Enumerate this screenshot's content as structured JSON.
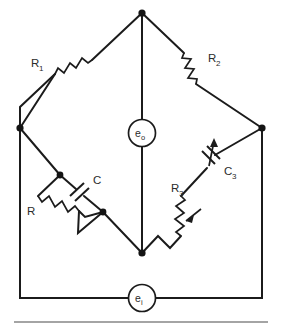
{
  "figure": {
    "type": "circuit-diagram",
    "name": "wien-bridge-circuit",
    "background_color": "#ffffff",
    "line_color": "#1b1b1b",
    "text_color": "#2b2b2b"
  },
  "components": {
    "r1": {
      "label": "R",
      "subscript": "1",
      "kind": "resistor",
      "branch": "top-left"
    },
    "r2": {
      "label": "R",
      "subscript": "2",
      "kind": "resistor",
      "branch": "top-right"
    },
    "r": {
      "label": "R",
      "subscript": "",
      "kind": "resistor",
      "branch": "lower-left-parallel"
    },
    "c": {
      "label": "C",
      "subscript": "",
      "kind": "capacitor",
      "branch": "lower-left-parallel"
    },
    "r3": {
      "label": "R",
      "subscript": "3",
      "kind": "variable-resistor",
      "branch": "lower-right"
    },
    "c3": {
      "label": "C",
      "subscript": "3",
      "kind": "variable-capacitor",
      "branch": "lower-right"
    }
  },
  "sources": {
    "output_meter": {
      "label": "e",
      "subscript": "o",
      "kind": "meter",
      "position": "center"
    },
    "input_source": {
      "label": "e",
      "subscript": "i",
      "kind": "source",
      "position": "bottom"
    }
  },
  "nodes": {
    "top": {
      "x": 142,
      "y": 13
    },
    "left": {
      "x": 20,
      "y": 128
    },
    "right": {
      "x": 262,
      "y": 128
    },
    "bottom_center": {
      "x": 142,
      "y": 253
    },
    "rc_top": {
      "x": 60,
      "y": 175
    },
    "rc_bottom": {
      "x": 103,
      "y": 212
    }
  }
}
